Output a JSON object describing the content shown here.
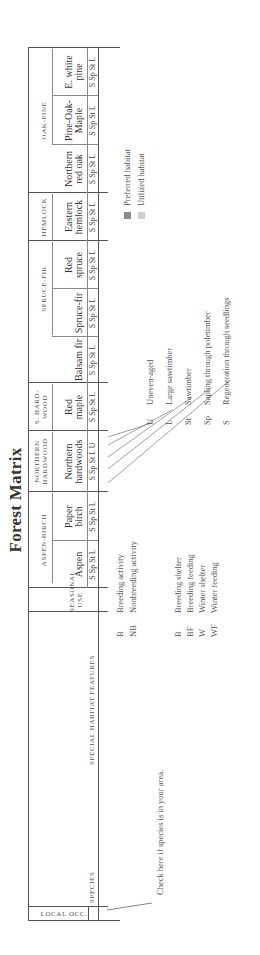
{
  "title": "Forest Matrix",
  "left_headers": {
    "local_occ": "LOCAL OCC.",
    "species": "SPECIES",
    "special_habitat_features": "SPECIAL HABITAT FEATURES",
    "seasonal_use": "SEASONAL USE"
  },
  "groups": [
    {
      "label": "ASPEN-BIRCH",
      "types": [
        {
          "name_l1": "",
          "name_l2": "Aspen",
          "ages": "S Sp St L"
        },
        {
          "name_l1": "Paper",
          "name_l2": "birch",
          "ages": "S Sp St L"
        }
      ]
    },
    {
      "label_l1": "NORTHERN",
      "label_l2": "HARDWOOD",
      "types": [
        {
          "name_l1": "Northern",
          "name_l2": "hardwoods",
          "ages": "S Sp St L U"
        }
      ]
    },
    {
      "label_l1": "S. HARD-",
      "label_l2": "WOOD",
      "types": [
        {
          "name_l1": "Red",
          "name_l2": "maple",
          "ages": "S Sp St L"
        }
      ]
    },
    {
      "label": "SPRUCE-FIR",
      "types": [
        {
          "name_l1": "",
          "name_l2": "Balsam fir",
          "ages": "S Sp St L"
        },
        {
          "name_l1": "",
          "name_l2": "Spruce-fir",
          "ages": "S Sp St L"
        },
        {
          "name_l1": "Red",
          "name_l2": "spruce",
          "ages": "S Sp St L"
        }
      ]
    },
    {
      "label": "HEMLOCK",
      "types": [
        {
          "name_l1": "Eastern",
          "name_l2": "hemlock",
          "ages": "S Sp St L"
        }
      ]
    },
    {
      "label": "OAK-PINE",
      "types": [
        {
          "name_l1": "Northern",
          "name_l2": "red oak",
          "ages": "S Sp St L"
        },
        {
          "name_l1": "Pine-Oak-",
          "name_l2": "Maple",
          "ages": "S Sp St L"
        },
        {
          "name_l1": "E. white",
          "name_l2": "pine",
          "ages": "S Sp St L"
        }
      ]
    }
  ],
  "check_note": "Check here if species is in your area.",
  "activity_legend": [
    {
      "abbr": "B",
      "text": "Breeding activity"
    },
    {
      "abbr": "NB",
      "text": "Nonbreeding activity"
    }
  ],
  "seasonal_legend": [
    {
      "abbr": "B",
      "text": "Breeding shelter"
    },
    {
      "abbr": "BF",
      "text": "Breeding feeding"
    },
    {
      "abbr": "W",
      "text": "Winter shelter"
    },
    {
      "abbr": "WF",
      "text": "Winter feeding"
    }
  ],
  "age_legend": [
    {
      "abbr": "U",
      "text": "Uneven-aged"
    },
    {
      "abbr": "L",
      "text": "Large sawtimber"
    },
    {
      "abbr": "St",
      "text": "Sawtimber"
    },
    {
      "abbr": "Sp",
      "text": "Sapling through poletimber"
    },
    {
      "abbr": "S",
      "text": "Regeneration through seedlings"
    }
  ],
  "habitat_legend": [
    {
      "text": "Preferred habitat",
      "color": "#8a8a8a"
    },
    {
      "text": "Utilized habitat",
      "color": "#cfcfcf"
    }
  ]
}
